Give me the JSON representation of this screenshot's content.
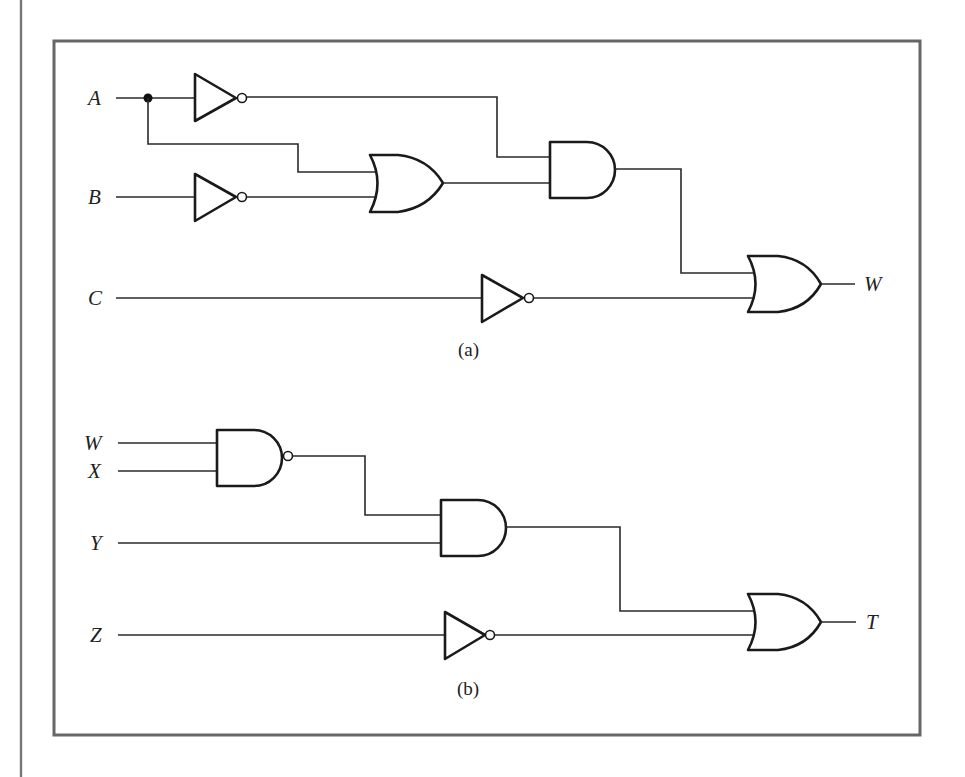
{
  "figure": {
    "page_edge": {
      "x": 21
    },
    "frame": {
      "left": 54,
      "top": 41,
      "right": 920,
      "bottom": 735,
      "color": "#666666"
    },
    "wire_color": "#2a2a2a",
    "gate_color": "#1a1a1a"
  },
  "circuit_a": {
    "caption": "(a)",
    "inputs": [
      {
        "label": "A",
        "y": 98
      },
      {
        "label": "B",
        "y": 197
      },
      {
        "label": "C",
        "y": 298
      }
    ],
    "output": {
      "label": "W",
      "y": 284
    },
    "gates": [
      {
        "id": "not_a",
        "type": "NOT",
        "input": "A"
      },
      {
        "id": "not_b",
        "type": "NOT",
        "input": "B"
      },
      {
        "id": "or_1",
        "type": "OR",
        "inputs": [
          "A",
          "not_b"
        ]
      },
      {
        "id": "and_1",
        "type": "AND",
        "inputs": [
          "not_a",
          "or_1"
        ]
      },
      {
        "id": "not_c",
        "type": "NOT",
        "input": "C"
      },
      {
        "id": "or_2",
        "type": "OR",
        "inputs": [
          "and_1",
          "not_c"
        ],
        "output": "W"
      }
    ]
  },
  "circuit_b": {
    "caption": "(b)",
    "inputs": [
      {
        "label": "W",
        "y": 443
      },
      {
        "label": "X",
        "y": 471
      },
      {
        "label": "Y",
        "y": 543
      },
      {
        "label": "Z",
        "y": 635
      }
    ],
    "output": {
      "label": "T",
      "y": 622
    },
    "gates": [
      {
        "id": "nand_1",
        "type": "NAND",
        "inputs": [
          "W",
          "X"
        ]
      },
      {
        "id": "and_2",
        "type": "AND",
        "inputs": [
          "nand_1",
          "Y"
        ]
      },
      {
        "id": "not_z",
        "type": "NOT",
        "input": "Z"
      },
      {
        "id": "or_3",
        "type": "OR",
        "inputs": [
          "and_2",
          "not_z"
        ],
        "output": "T"
      }
    ]
  }
}
